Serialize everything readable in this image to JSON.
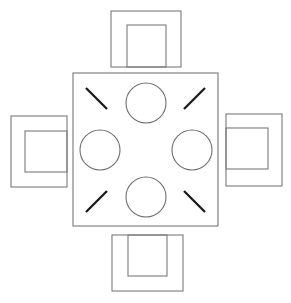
{
  "diagram": {
    "view": "top-down",
    "canvas": {
      "width": 291,
      "height": 303,
      "background": "#ffffff"
    },
    "stroke_colors": {
      "furniture_outline": "#7a7a7a",
      "plate_outline": "#6e6e6e",
      "utensil": "#1a1a1a"
    },
    "table": {
      "label": "dining-table",
      "shape": "square",
      "x": 73,
      "y": 73,
      "width": 145,
      "height": 153
    },
    "plates": [
      {
        "label": "plate-north",
        "seat": "top",
        "cx": 146,
        "cy": 103,
        "r": 20
      },
      {
        "label": "plate-west",
        "seat": "left",
        "cx": 100,
        "cy": 150,
        "r": 20
      },
      {
        "label": "plate-east",
        "seat": "right",
        "cx": 192,
        "cy": 150,
        "r": 20
      },
      {
        "label": "plate-south",
        "seat": "bottom",
        "cx": 146,
        "cy": 197,
        "r": 20
      }
    ],
    "utensils": [
      {
        "label": "utensil-top-left",
        "x1": 86,
        "y1": 88,
        "x2": 107,
        "y2": 109
      },
      {
        "label": "utensil-top-right",
        "x1": 205,
        "y1": 88,
        "x2": 184,
        "y2": 109
      },
      {
        "label": "utensil-bottom-left",
        "x1": 86,
        "y1": 212,
        "x2": 107,
        "y2": 191
      },
      {
        "label": "utensil-bottom-right",
        "x1": 205,
        "y1": 212,
        "x2": 184,
        "y2": 191
      }
    ],
    "chairs": [
      {
        "label": "chair-north",
        "position": "top",
        "outer": {
          "x": 111,
          "y": 11,
          "width": 70,
          "height": 56
        },
        "inner": {
          "x": 127,
          "y": 25,
          "width": 39,
          "height": 42
        }
      },
      {
        "label": "chair-west",
        "position": "left",
        "outer": {
          "x": 11,
          "y": 116,
          "width": 56,
          "height": 71
        },
        "inner": {
          "x": 25,
          "y": 131,
          "width": 42,
          "height": 41
        }
      },
      {
        "label": "chair-east",
        "position": "right",
        "outer": {
          "x": 226,
          "y": 114,
          "width": 56,
          "height": 72
        },
        "inner": {
          "x": 226,
          "y": 128,
          "width": 42,
          "height": 41
        }
      },
      {
        "label": "chair-south",
        "position": "bottom",
        "outer": {
          "x": 112,
          "y": 235,
          "width": 71,
          "height": 56
        },
        "inner": {
          "x": 128,
          "y": 235,
          "width": 39,
          "height": 41
        }
      }
    ]
  }
}
